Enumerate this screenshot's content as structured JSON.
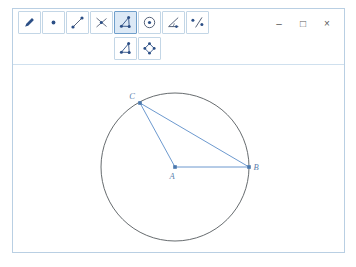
{
  "window": {
    "title": "",
    "controls": [
      {
        "name": "minimize",
        "glyph": "–"
      },
      {
        "name": "maximize",
        "glyph": "□"
      },
      {
        "name": "close",
        "glyph": "×"
      }
    ]
  },
  "toolbar": {
    "row1": [
      {
        "name": "pen-tool",
        "icon": "pen-icon",
        "label": "Pen",
        "active": false
      },
      {
        "name": "point-tool",
        "icon": "point-icon",
        "label": "Point",
        "active": false
      },
      {
        "name": "segment-tool",
        "icon": "segment-icon",
        "label": "Segment",
        "active": false
      },
      {
        "name": "intersect-tool",
        "icon": "intersecting-lines-icon",
        "label": "Intersect",
        "active": false
      },
      {
        "name": "polygon-tool",
        "icon": "triangle-points-icon",
        "label": "Polygon",
        "active": true
      },
      {
        "name": "circle-tool",
        "icon": "circle-center-icon",
        "label": "Circle",
        "active": false
      },
      {
        "name": "angle-tool",
        "icon": "angle-icon",
        "label": "Angle",
        "active": false
      },
      {
        "name": "parallel-line-tool",
        "icon": "line-points-icon",
        "label": "Parallel Line",
        "active": false
      }
    ],
    "row2": [
      {
        "name": "polygon-subtool",
        "icon": "triangle-points-icon",
        "label": "Polygon",
        "active": false
      },
      {
        "name": "rigid-polygon-subtool",
        "icon": "quad-points-icon",
        "label": "Rigid Polygon",
        "active": false
      }
    ]
  },
  "colors": {
    "accent": "#5b8dc8",
    "stroke": "#4a4a4a",
    "toolbar_border": "#c3d6e6",
    "active_bg": "#dce9f6",
    "icon_blue": "#2c4f86"
  },
  "canvas": {
    "circle": {
      "label": "circle-centered-at-A",
      "cx": 162,
      "cy": 102,
      "r": 74
    },
    "points": [
      {
        "id": "A",
        "label": "A",
        "x": 162,
        "y": 102,
        "label_dx": -3,
        "label_dy": 12
      },
      {
        "id": "B",
        "label": "B",
        "x": 236,
        "y": 102,
        "label_dx": 7,
        "label_dy": 3
      },
      {
        "id": "C",
        "label": "C",
        "x": 127,
        "y": 38,
        "label_dx": -8,
        "label_dy": -4
      }
    ],
    "segments": [
      {
        "label": "segment-AB",
        "from": "A",
        "to": "B"
      },
      {
        "label": "segment-AC",
        "from": "A",
        "to": "C"
      },
      {
        "label": "segment-CB",
        "from": "C",
        "to": "B"
      }
    ]
  }
}
